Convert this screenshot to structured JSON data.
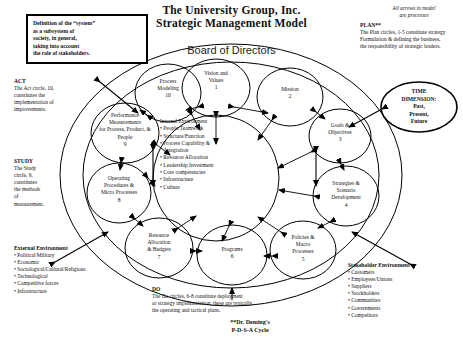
{
  "title": {
    "line1": "The University Group, Inc.",
    "line2": "Strategic Management Model"
  },
  "board_label": "Board of Directors",
  "definition_box": {
    "l1": "Definition of the “system”",
    "l2": "as a subsystem of",
    "l3": "society, in general,",
    "l4": "taking into account",
    "l5": "the role of stakeholders."
  },
  "arrows_note": {
    "l1": "All arrows in model",
    "l2": "are processes"
  },
  "plan_note": {
    "heading": "PLAN**",
    "l1": "The Plan circles, 1-5 constitute strategy",
    "l2": "Formulation & defining the business,",
    "l3": "the responsibility of strategic leaders."
  },
  "act_note": {
    "heading": "ACT",
    "l1": "The Act circle, 10,",
    "l2": "constitutes the",
    "l3": "implementation of",
    "l4": "improvements."
  },
  "study_note": {
    "heading": "STUDY",
    "l1": "The Study",
    "l2": "circle, 9,",
    "l3": "constitutes",
    "l4": "the methods",
    "l5": "of",
    "l6": "measurement."
  },
  "do_note": {
    "heading": "DO",
    "l1": "The Do circles, 6-8 constitute deployment",
    "l2": "or strategy implementation; these are typically",
    "l3": "the operating and tactical plans."
  },
  "deming_note": {
    "l1": "**Dr. Deming's",
    "l2": "P-D-S-A Cycle"
  },
  "time_dimension": {
    "l1": "TIME",
    "l2": "DIMENSION:",
    "l3": "Past,",
    "l4": "Present,",
    "l5": "Future"
  },
  "external_environment": {
    "heading": "External Environment",
    "items": [
      "Political/Military",
      "Economic",
      "Sociological/Cultural/Religious",
      "Technological",
      "Competitive forces",
      "Infrastructure"
    ]
  },
  "stakeholder_environment": {
    "heading": "Stakeholder Environment",
    "items": [
      "Customers",
      "Employees/Unions",
      "Suppliers",
      "Stockholders",
      "Communities",
      "Governments",
      "Competitors"
    ]
  },
  "internal_environment": {
    "heading": "Internal Environment",
    "items": [
      "People/Teamwork",
      "Structure/Function",
      "Process Capability &",
      "Integration",
      "Resource Allocation",
      "Leadership Investment",
      "Core competencies",
      "Infrastructure",
      "Culture"
    ]
  },
  "circles": [
    {
      "id": "vision-values",
      "l1": "Vision and",
      "l2": "Values",
      "l3": "",
      "num": "1"
    },
    {
      "id": "mission",
      "l1": "Mission",
      "l2": "",
      "l3": "",
      "num": "2"
    },
    {
      "id": "goals-objectives",
      "l1": "Goals &",
      "l2": "Objectives",
      "l3": "",
      "num": "3"
    },
    {
      "id": "strategies-scenario",
      "l1": "Strategies &",
      "l2": "Scenario",
      "l3": "Development",
      "num": "4"
    },
    {
      "id": "policies-macro",
      "l1": "Policies &",
      "l2": "Macro",
      "l3": "Processes",
      "num": "5"
    },
    {
      "id": "programs",
      "l1": "Programs",
      "l2": "",
      "l3": "",
      "num": "6"
    },
    {
      "id": "resource-allocation",
      "l1": "Resource",
      "l2": "Allocation",
      "l3": "& Budgets",
      "num": "7"
    },
    {
      "id": "operating-procedures",
      "l1": "Operating",
      "l2": "Procedures &",
      "l3": "Micro Processes",
      "num": "8"
    },
    {
      "id": "performance-measure",
      "l1": "Performance",
      "l2": "Measurements",
      "l3": "for Process, Product, & People",
      "num": "9"
    },
    {
      "id": "process-modeling",
      "l1": "Process",
      "l2": "Modeling",
      "l3": "",
      "num": "10"
    }
  ],
  "colors": {
    "stroke": "#000000",
    "background": "#ffffff",
    "text": "#111111"
  }
}
